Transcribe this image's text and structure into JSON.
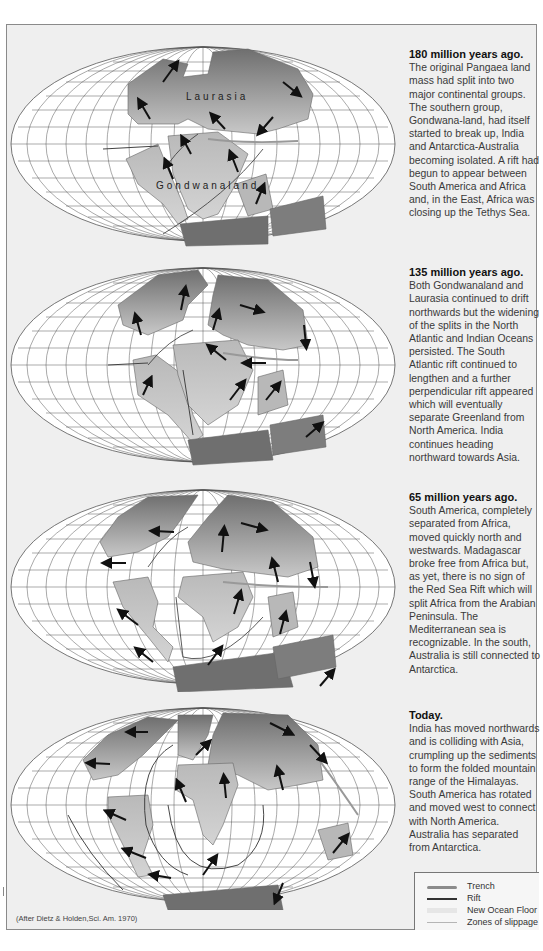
{
  "panels": [
    {
      "id": "180ma",
      "title": "180 million years ago.",
      "text": "The original Pangaea land mass had split into two major continental groups. The southern group, Gondwana-land, had itself started to break up, India and Antarctica-Australia becoming isolated. A rift had begun to appear between South America and Africa and, in the East, Africa was closing up the Tethys Sea.",
      "map_labels": [
        "Laurasia",
        "Gondwanaland"
      ]
    },
    {
      "id": "135ma",
      "title": "135 million years ago.",
      "text": "Both Gondwanaland and Laurasia continued to drift northwards but the widening of the splits in the North Atlantic and Indian Oceans persisted. The South Atlantic rift continued to lengthen and a further perpendicular rift appeared which will eventually separate Greenland from North America. India continues heading northward towards Asia."
    },
    {
      "id": "65ma",
      "title": "65 million years ago.",
      "text": "South America, completely separated from Africa, moved quickly north and westwards. Madagascar broke free from Africa but, as yet, there is no sign of the Red Sea Rift which will split Africa from the Arabian Peninsula. The Mediterranean sea is recognizable. In the south, Australia is still connected to Antarctica."
    },
    {
      "id": "today",
      "title": "Today.",
      "text": "India has moved northwards and is colliding with Asia, crumpling up the sediments to form the folded mountain range of the Himalayas. South America has rotated and moved west to connect with North America. Australia has separated from Antarctica."
    }
  ],
  "legend": {
    "items": [
      {
        "label": "Trench",
        "color": "#8c8c8c",
        "style": "thick-wavy"
      },
      {
        "label": "Rift",
        "color": "#333333",
        "style": "line"
      },
      {
        "label": "New Ocean Floor",
        "color": "#e6e6e6",
        "style": "band"
      },
      {
        "label": "Zones of slippage",
        "color": "#b5b5b5",
        "style": "thin"
      }
    ]
  },
  "credit": "(After Dietz & Holden,Sci. Am. 1970)",
  "colors": {
    "background": "#efefef",
    "land_dark": "#7d7d7d",
    "land_light": "#c9c9c9",
    "grid": "#555555",
    "ocean": "#ffffff"
  }
}
